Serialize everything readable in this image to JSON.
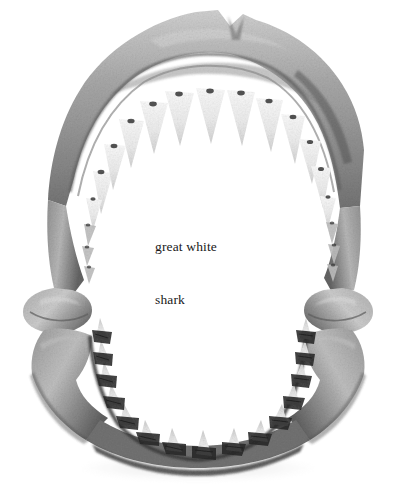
{
  "figure": {
    "medium": "grayscale photograph",
    "background_color": "#ffffff",
    "caption": {
      "line1": "great white",
      "line2": "shark",
      "full_text": "great white shark",
      "color": "#191919",
      "position": "center of jaw cavity"
    },
    "anatomy": {
      "upper_jaw_label": "upper jaw arch",
      "lower_jaw_label": "lower jaw arch",
      "hinge_label": "jaw articulation",
      "upper_teeth_label": "upper tooth row",
      "lower_teeth_label": "lower tooth row",
      "notch_label": "symphysial notch"
    },
    "palette": {
      "cartilage_light": "#c8c8c8",
      "cartilage_mid": "#9a9a9a",
      "cartilage_dark": "#6a6a6a",
      "cartilage_deep": "#3c3c3c",
      "tooth_pale": "#f2f2f2",
      "tooth_shade": "#d8d8d8",
      "socket_dark": "#2a2a2a",
      "shadow": "#e6e6e6"
    }
  }
}
